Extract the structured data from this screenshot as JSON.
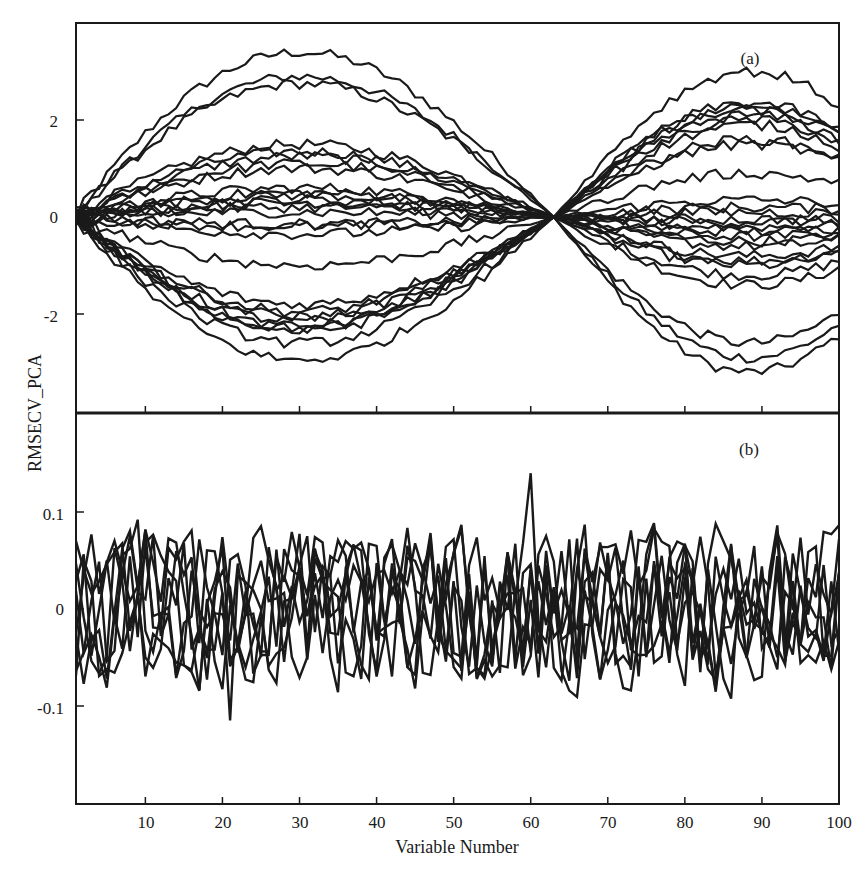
{
  "chart_data": [
    {
      "panel": "a",
      "type": "line",
      "panel_label": "(a)",
      "xlabel": "Variable Number",
      "ylabel": "RMSECV_PCA",
      "xlim": [
        1,
        100
      ],
      "ylim": [
        -4,
        4
      ],
      "yticks": [
        2,
        0,
        -2
      ],
      "ytick_labels": [
        "2",
        "0",
        "-2"
      ],
      "xticks": [
        10,
        20,
        30,
        40,
        50,
        60,
        70,
        80,
        90
      ],
      "grid": false,
      "legend": null,
      "shape_note": "Each series is a two-lobe curve: first lobe over variables 1-63 peaking near variable 42, all curves crossing 0 near variable 63, second lobe over 63-100 peaking near variable 86. Values listed are lobe peak amplitudes.",
      "crossing_variable": 63,
      "lobe1_peak_variable": 42,
      "lobe2_peak_variable": 86,
      "series": [
        {
          "name": "s1",
          "lobe1_peak": 3.4,
          "lobe2_peak": -3.2
        },
        {
          "name": "s2",
          "lobe1_peak": 2.9,
          "lobe2_peak": -2.9
        },
        {
          "name": "s3",
          "lobe1_peak": 2.75,
          "lobe2_peak": -2.6
        },
        {
          "name": "s4",
          "lobe1_peak": 1.5,
          "lobe2_peak": -1.4
        },
        {
          "name": "s5",
          "lobe1_peak": 1.35,
          "lobe2_peak": -1.2
        },
        {
          "name": "s6",
          "lobe1_peak": 1.25,
          "lobe2_peak": -1.0
        },
        {
          "name": "s7",
          "lobe1_peak": 1.1,
          "lobe2_peak": -0.9
        },
        {
          "name": "s8",
          "lobe1_peak": 1.0,
          "lobe2_peak": -0.8
        },
        {
          "name": "s9",
          "lobe1_peak": 0.6,
          "lobe2_peak": -0.6
        },
        {
          "name": "s10",
          "lobe1_peak": 0.5,
          "lobe2_peak": -0.5
        },
        {
          "name": "s11",
          "lobe1_peak": 0.45,
          "lobe2_peak": -0.4
        },
        {
          "name": "s12",
          "lobe1_peak": 0.35,
          "lobe2_peak": -0.3
        },
        {
          "name": "s13",
          "lobe1_peak": 0.3,
          "lobe2_peak": -0.2
        },
        {
          "name": "s14",
          "lobe1_peak": 0.2,
          "lobe2_peak": -0.1
        },
        {
          "name": "s15",
          "lobe1_peak": 0.1,
          "lobe2_peak": 0.1
        },
        {
          "name": "s16",
          "lobe1_peak": -0.15,
          "lobe2_peak": -0.05
        },
        {
          "name": "s17",
          "lobe1_peak": -0.2,
          "lobe2_peak": 0.2
        },
        {
          "name": "s18",
          "lobe1_peak": -0.35,
          "lobe2_peak": 0.35
        },
        {
          "name": "s19",
          "lobe1_peak": -1.0,
          "lobe2_peak": 0.9
        },
        {
          "name": "s20",
          "lobe1_peak": -1.8,
          "lobe2_peak": 1.5
        },
        {
          "name": "s21",
          "lobe1_peak": -1.95,
          "lobe2_peak": 1.6
        },
        {
          "name": "s22",
          "lobe1_peak": -2.05,
          "lobe2_peak": 1.9
        },
        {
          "name": "s23",
          "lobe1_peak": -2.15,
          "lobe2_peak": 2.0
        },
        {
          "name": "s24",
          "lobe1_peak": -2.25,
          "lobe2_peak": 2.1
        },
        {
          "name": "s25",
          "lobe1_peak": -2.3,
          "lobe2_peak": 2.2
        },
        {
          "name": "s26",
          "lobe1_peak": -2.35,
          "lobe2_peak": 2.3
        },
        {
          "name": "s27",
          "lobe1_peak": -2.6,
          "lobe2_peak": 2.35
        },
        {
          "name": "s28",
          "lobe1_peak": -2.95,
          "lobe2_peak": 3.0
        }
      ]
    },
    {
      "panel": "b",
      "type": "line",
      "panel_label": "(b)",
      "xlabel": "Variable Number",
      "ylabel": "RMSECV_PCA",
      "xlim": [
        1,
        100
      ],
      "ylim": [
        -0.2,
        0.2
      ],
      "yticks": [
        0.1,
        0,
        -0.1
      ],
      "ytick_labels": [
        "0.1",
        "0",
        "-0.1"
      ],
      "xticks": [
        10,
        20,
        30,
        40,
        50,
        60,
        70,
        80,
        90,
        100
      ],
      "xtick_labels": [
        "10",
        "20",
        "30",
        "40",
        "50",
        "60",
        "70",
        "80",
        "90",
        "100"
      ],
      "grid": false,
      "legend": null,
      "shape_note": "About 8 noise-like residual series fluctuating around 0 over all 100 variables, mostly between -0.1 and +0.1; max spike about 0.14 near variable 60, min about -0.115 near variable 21.",
      "series_count": 8,
      "noise_amplitude": 0.055,
      "max_point": {
        "x": 60,
        "y": 0.14
      },
      "min_point": {
        "x": 21,
        "y": -0.115
      }
    }
  ],
  "figure": {
    "xlabel": "Variable Number",
    "ylabel": "RMSECV_PCA",
    "panel_a_label": "(a)",
    "panel_b_label": "(b)",
    "line_color": "#1a1a1a",
    "background": "#ffffff"
  }
}
